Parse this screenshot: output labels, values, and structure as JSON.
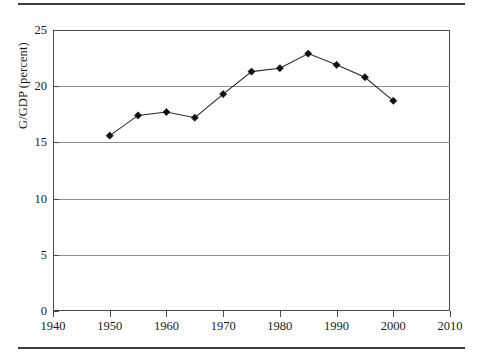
{
  "figure": {
    "top_rule": "horizontal-rule",
    "bottom_rule": "horizontal-rule"
  },
  "chart_data": {
    "type": "line",
    "title": "",
    "xlabel": "",
    "ylabel": "G/GDP (percent)",
    "xlim": [
      1940,
      2010
    ],
    "ylim": [
      0,
      25
    ],
    "xticks": [
      1940,
      1950,
      1960,
      1970,
      1980,
      1990,
      2000,
      2010
    ],
    "xtick_labels": [
      "1940",
      "1950",
      "1960",
      "1970",
      "1980",
      "1990",
      "2000",
      "2010"
    ],
    "yticks": [
      0,
      5,
      10,
      15,
      20,
      25
    ],
    "ytick_labels": [
      "0",
      "5",
      "10",
      "15",
      "20",
      "25"
    ],
    "grid": "horizontal",
    "legend": "none",
    "marker": "diamond",
    "line_color": "#2a2a2a",
    "marker_color": "#111111",
    "grid_color": "#8d8d8d",
    "x": [
      1950,
      1955,
      1960,
      1965,
      1970,
      1975,
      1980,
      1985,
      1990,
      1995,
      2000
    ],
    "values": [
      15.6,
      17.4,
      17.7,
      17.2,
      19.3,
      21.3,
      21.6,
      22.9,
      21.9,
      20.8,
      18.7
    ],
    "series": [
      {
        "name": "G/GDP",
        "x": [
          1950,
          1955,
          1960,
          1965,
          1970,
          1975,
          1980,
          1985,
          1990,
          1995,
          2000
        ],
        "values": [
          15.6,
          17.4,
          17.7,
          17.2,
          19.3,
          21.3,
          21.6,
          22.9,
          21.9,
          20.8,
          18.7
        ]
      }
    ]
  }
}
